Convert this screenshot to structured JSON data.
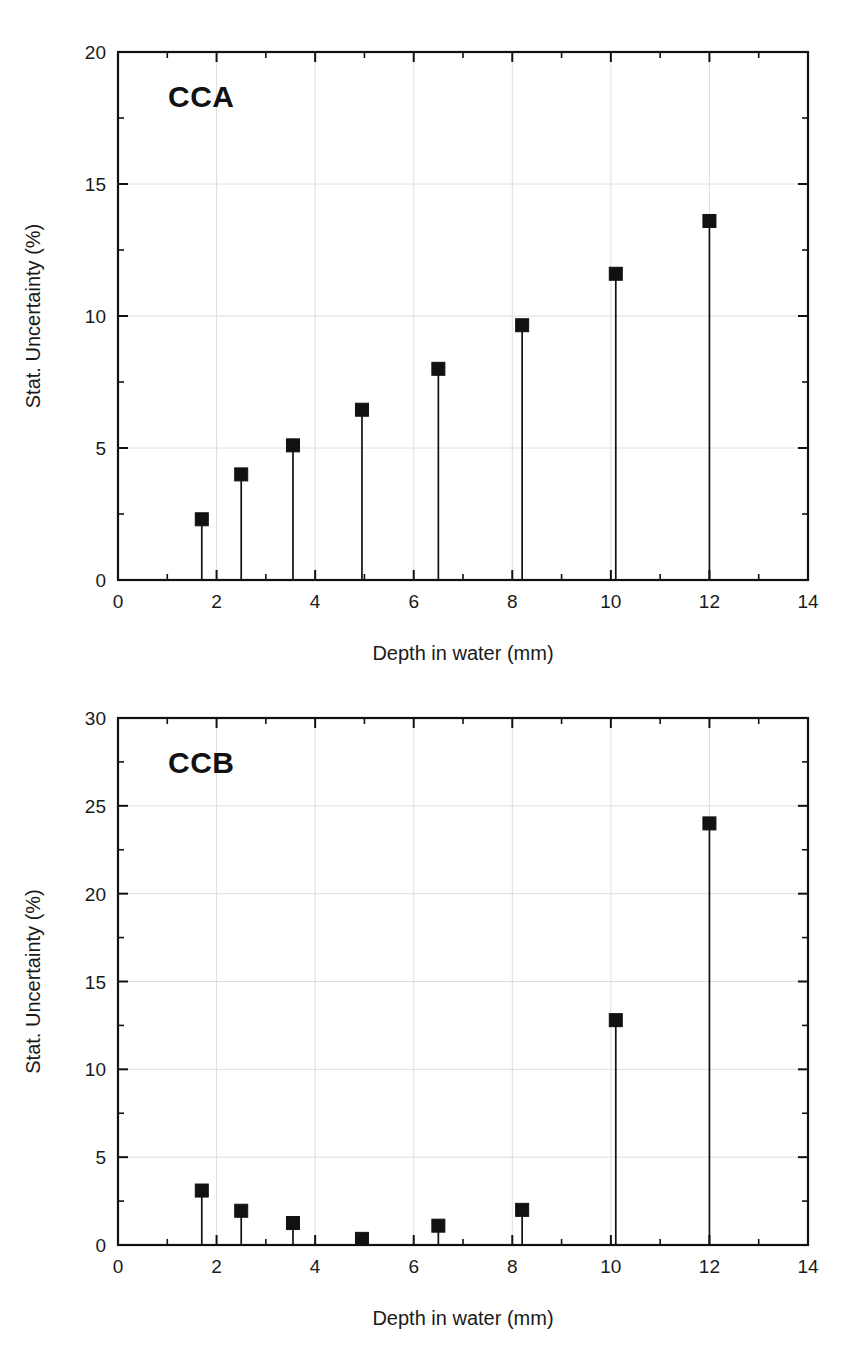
{
  "figures": [
    {
      "id": "cca",
      "panel_label": "CCA",
      "xlabel": "Depth in water (mm)",
      "ylabel": "Stat. Uncertainty (%)",
      "x_ticks": [
        "0",
        "2",
        "4",
        "6",
        "8",
        "10",
        "12",
        "14"
      ],
      "y_ticks": [
        "0",
        "5",
        "10",
        "15",
        "20"
      ]
    },
    {
      "id": "ccb",
      "panel_label": "CCB",
      "xlabel": "Depth in water (mm)",
      "ylabel": "Stat. Uncertainty (%)",
      "x_ticks": [
        "0",
        "2",
        "4",
        "6",
        "8",
        "10",
        "12",
        "14"
      ],
      "y_ticks": [
        "0",
        "5",
        "10",
        "15",
        "20",
        "25",
        "30"
      ]
    }
  ],
  "colors": {
    "marker": "#111111",
    "axis": "#111111",
    "grid": "#dedede",
    "background": "#ffffff"
  },
  "chart_data": [
    {
      "type": "scatter",
      "id": "cca",
      "title": "CCA",
      "xlabel": "Depth in water (mm)",
      "ylabel": "Stat. Uncertainty (%)",
      "xlim": [
        0,
        14
      ],
      "ylim": [
        0,
        20
      ],
      "x_major_ticks": [
        0,
        2,
        4,
        6,
        8,
        10,
        12,
        14
      ],
      "x_minor_interval": 1,
      "y_major_ticks": [
        0,
        5,
        10,
        15,
        20
      ],
      "y_minor_interval": 2.5,
      "grid": true,
      "legend": "none",
      "marker_style": "filled-square",
      "stems": true,
      "x": [
        1.7,
        2.5,
        3.55,
        4.95,
        6.5,
        8.2,
        10.1,
        12.0
      ],
      "values": [
        2.3,
        4.0,
        5.1,
        6.45,
        8.0,
        9.65,
        11.6,
        13.6
      ]
    },
    {
      "type": "scatter",
      "id": "ccb",
      "title": "CCB",
      "xlabel": "Depth in water (mm)",
      "ylabel": "Stat. Uncertainty (%)",
      "xlim": [
        0,
        14
      ],
      "ylim": [
        0,
        30
      ],
      "x_major_ticks": [
        0,
        2,
        4,
        6,
        8,
        10,
        12,
        14
      ],
      "x_minor_interval": 1,
      "y_major_ticks": [
        0,
        5,
        10,
        15,
        20,
        25,
        30
      ],
      "y_minor_interval": 2.5,
      "grid": true,
      "legend": "none",
      "marker_style": "filled-square",
      "stems": true,
      "x": [
        1.7,
        2.5,
        3.55,
        4.95,
        6.5,
        8.2,
        10.1,
        12.0
      ],
      "values": [
        3.1,
        1.95,
        1.25,
        0.35,
        1.1,
        2.0,
        12.8,
        24.0
      ]
    }
  ]
}
